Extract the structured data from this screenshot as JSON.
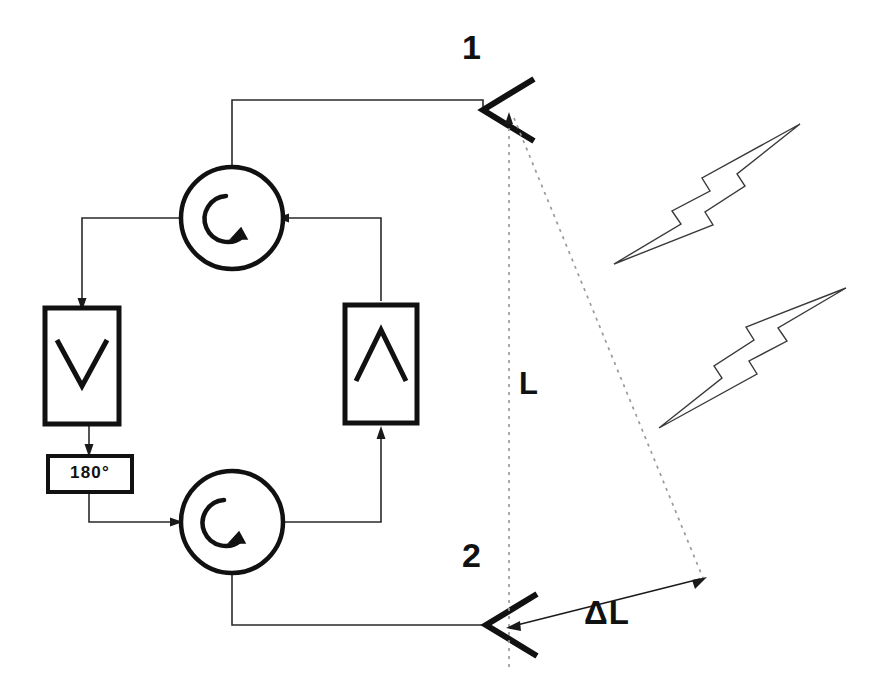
{
  "diagram": {
    "type": "block-diagram",
    "background_color": "#ffffff",
    "line_color": "#111111",
    "reference_line_color": "#9a9a9a"
  },
  "antennas": [
    {
      "id": "antenna-1",
      "label": "1",
      "shape": "horn-vee",
      "apex": [
        483,
        110
      ],
      "opening_direction": "right"
    },
    {
      "id": "antenna-2",
      "label": "2",
      "shape": "horn-vee",
      "apex": [
        486,
        625
      ],
      "opening_direction": "right"
    }
  ],
  "dimensions": {
    "baseline_label": "L",
    "baseline_description": "vertical separation between antenna 1 and antenna 2",
    "path_difference_label": "ΔL",
    "path_difference_description": "differential path length to the wavefront"
  },
  "components": [
    {
      "id": "circulator-top",
      "type": "circulator",
      "symbol": "circular-arc-arrow",
      "ports": [
        "top",
        "left",
        "right"
      ],
      "center": [
        232,
        218
      ]
    },
    {
      "id": "circulator-bottom",
      "type": "circulator",
      "symbol": "circular-arc-arrow",
      "ports": [
        "left",
        "right",
        "bottom"
      ],
      "center": [
        232,
        522
      ]
    },
    {
      "id": "amplifier-left",
      "type": "amplifier",
      "symbol": "chevron-down",
      "direction": "down",
      "box": [
        45,
        308,
        74,
        116
      ]
    },
    {
      "id": "amplifier-right",
      "type": "amplifier",
      "symbol": "chevron-up",
      "direction": "up",
      "box": [
        345,
        305,
        72,
        118
      ]
    },
    {
      "id": "phase-shifter",
      "type": "phase-shifter",
      "label": "180°",
      "box": [
        48,
        456,
        84,
        36
      ]
    }
  ],
  "waves": [
    {
      "id": "wave-upper",
      "type": "lightning-bolt",
      "direction": "incoming-left",
      "description": "RF wavefront arriving from upper right"
    },
    {
      "id": "wave-lower",
      "type": "lightning-bolt",
      "direction": "outgoing-right",
      "description": "RF wavefront departing toward upper right"
    }
  ],
  "labels": {
    "antenna_1": "1",
    "antenna_2": "2",
    "baseline": "L",
    "path_difference": "ΔL",
    "phase_shift": "180°"
  }
}
